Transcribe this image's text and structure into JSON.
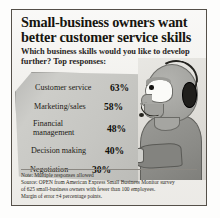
{
  "headline": "Small-business owners want better customer service skills",
  "subhead": "Which business skills would you like to develop further? Top responses:",
  "chart_data": {
    "type": "bar",
    "title": "Small-business owners want better customer service skills",
    "subtitle": "Which business skills would you like to develop further? Top responses:",
    "categories": [
      "Customer service",
      "Marketing/sales",
      "Financial management",
      "Decision making",
      "Negotiation"
    ],
    "values": [
      63,
      58,
      48,
      40,
      30
    ],
    "value_labels": [
      "63%",
      "58%",
      "48%",
      "40%",
      "30%"
    ],
    "unit": "%",
    "xlabel": "",
    "ylabel": "",
    "ylim": [
      0,
      100
    ],
    "grid": false,
    "legend": false,
    "rows": [
      {
        "label_line1": "Customer service",
        "label_line2": "",
        "value": "63%"
      },
      {
        "label_line1": "Marketing/sales",
        "label_line2": "",
        "value": "58%"
      },
      {
        "label_line1": "Financial",
        "label_line2": "management",
        "value": "48%"
      },
      {
        "label_line1": "Decision making",
        "label_line2": "",
        "value": "40%"
      },
      {
        "label_line1": "Negotiation",
        "label_line2": "",
        "value": "30%"
      }
    ]
  },
  "notes": {
    "note": "Note: Multiple responses allowed",
    "source_line1": "Source: OPEN from American Express Small Business Monitor survey",
    "source_line2": "of 625 small-business owners with fewer than 100 employees.",
    "margin": "Margin of error ±4 percentage points."
  },
  "illustration": {
    "name": "headset-operator-illustration",
    "description": "Stylized profile of a person wearing a telephone headset"
  },
  "colors": {
    "panel_gray": "#c6c6c2",
    "paper": "#f2f1ee",
    "frame": "#555049",
    "text": "#17150f",
    "figure_body": "#8b8b87",
    "headset_dark": "#201f1c"
  }
}
